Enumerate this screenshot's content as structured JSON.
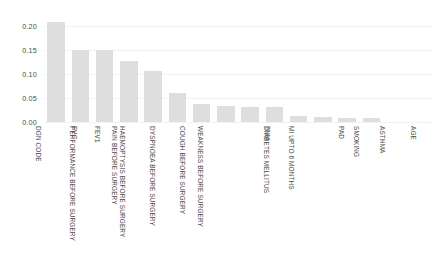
{
  "chart_data": {
    "type": "bar",
    "title": "",
    "subtitle": "",
    "xlabel": "",
    "ylabel": "",
    "ylim": [
      0.0,
      0.225
    ],
    "grid": true,
    "legend": "none",
    "orientation": "vertical",
    "bar_color": "#dededf",
    "background_color": "#ffffff",
    "x_tick_rotation": 90,
    "ytick_labels": [
      "0.00",
      "0.05",
      "0.10",
      "0.15",
      "0.20"
    ],
    "ytick_values": [
      0.0,
      0.05,
      0.1,
      0.15,
      0.2
    ],
    "categories": [
      "DGN CODE",
      "FVC",
      "FEV1",
      "PERFORMANCE BEFORE SURGERY",
      "PAIN BEFORE SURGERY",
      "HAEMOPTYSIS BEFORE SURGERY",
      "DYSPNOEA BEFORE SURGERY",
      "COUGH BEFORE SURGERY",
      "WEAKNESS BEFORE SURGERY",
      "TNM",
      "DIABETES MELLITUS",
      "MI UPTO 6 MONTHS",
      "PAD",
      "SMOKING",
      "ASTHMA",
      "AGE"
    ],
    "values": [
      0.208,
      0.151,
      0.151,
      0.127,
      0.107,
      0.06,
      0.037,
      0.033,
      0.032,
      0.031,
      0.012,
      0.011,
      0.009,
      0.008,
      0.0,
      0.0
    ]
  }
}
